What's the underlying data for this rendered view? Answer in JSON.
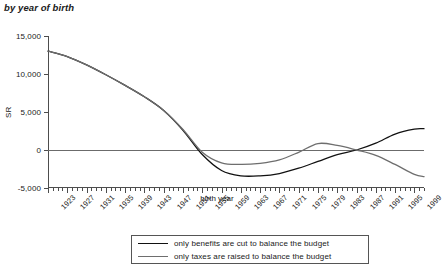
{
  "chart_data": {
    "type": "line",
    "title": "by year of birth",
    "xlabel": "birth year",
    "ylabel": "SR",
    "xlim": [
      1923,
      2001
    ],
    "ylim": [
      -5000,
      15000
    ],
    "ytick_values": [
      15000,
      10000,
      5000,
      0,
      -5000
    ],
    "ytick_labels": [
      "15,000",
      "10,000",
      "5,000",
      "0",
      "-5,000"
    ],
    "xtick_labels": [
      "1923",
      "1927",
      "1931",
      "1935",
      "1939",
      "1943",
      "1947",
      "1951",
      "1955",
      "1959",
      "1963",
      "1967",
      "1971",
      "1975",
      "1979",
      "1983",
      "1987",
      "1991",
      "1995",
      "1999"
    ],
    "xtick_step": 4,
    "minor_tick_step": 1,
    "grid": false,
    "legend_position": "bottom",
    "series": [
      {
        "name": "only benefits are cut to balance the budget",
        "color": "#111111",
        "x": [
          1923,
          1927,
          1931,
          1935,
          1939,
          1943,
          1947,
          1951,
          1955,
          1959,
          1963,
          1967,
          1971,
          1975,
          1979,
          1983,
          1987,
          1991,
          1995,
          1999,
          2001
        ],
        "values": [
          13000,
          12300,
          11200,
          9900,
          8500,
          7000,
          5200,
          2600,
          -600,
          -2700,
          -3400,
          -3400,
          -3100,
          -2400,
          -1500,
          -600,
          0,
          900,
          2100,
          2750,
          2800
        ]
      },
      {
        "name": "only taxes are raised to balance the budget",
        "color": "#6e6e6e",
        "x": [
          1923,
          1927,
          1931,
          1935,
          1939,
          1943,
          1947,
          1951,
          1955,
          1959,
          1963,
          1967,
          1971,
          1975,
          1979,
          1983,
          1987,
          1991,
          1995,
          1999,
          2001
        ],
        "values": [
          13000,
          12300,
          11200,
          9900,
          8500,
          7000,
          5200,
          2700,
          -300,
          -1700,
          -1900,
          -1750,
          -1300,
          -300,
          850,
          600,
          0,
          -700,
          -1900,
          -3200,
          -3500
        ]
      }
    ]
  },
  "legend": {
    "entries": [
      "only benefits are cut to balance the budget",
      "only taxes are raised to balance the budget"
    ]
  }
}
